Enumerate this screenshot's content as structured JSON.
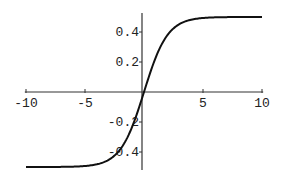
{
  "chart_data": {
    "type": "line",
    "title": "",
    "xlabel": "",
    "ylabel": "",
    "xlim": [
      -10,
      10
    ],
    "ylim": [
      -0.5,
      0.5
    ],
    "grid": false,
    "legend": null,
    "x_ticks": [
      -10,
      -5,
      5,
      10
    ],
    "x_tick_labels": [
      "-10",
      "-5",
      "5",
      "10"
    ],
    "y_ticks": [
      0.4,
      0.2,
      -0.2,
      -0.4
    ],
    "y_tick_labels": [
      "0.4",
      "0.2",
      "-0.2",
      "-0.4"
    ],
    "series": [
      {
        "name": "1/(1+e^-x) - 1/2",
        "x": [
          -10,
          -8,
          -6,
          -5,
          -4,
          -3,
          -2,
          -1,
          0,
          1,
          2,
          3,
          4,
          5,
          6,
          8,
          10
        ],
        "y": [
          -0.49995,
          -0.49966,
          -0.49753,
          -0.49331,
          -0.48201,
          -0.45257,
          -0.3808,
          -0.23106,
          0,
          0.23106,
          0.3808,
          0.45257,
          0.48201,
          0.49331,
          0.49753,
          0.49966,
          0.49995
        ]
      }
    ]
  },
  "colors": {
    "curve": "#111111",
    "axis": "#333333",
    "text": "#222222"
  }
}
